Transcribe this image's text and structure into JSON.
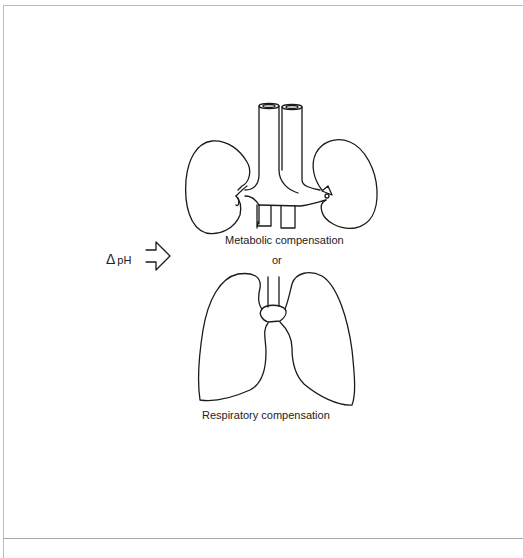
{
  "figure": {
    "trigger": {
      "delta_symbol": "Δ",
      "label": "pH",
      "arrow_icon": "hollow-right-arrow"
    },
    "organs": [
      {
        "name": "kidneys-and-great-vessels",
        "label": "Metabolic compensation"
      },
      {
        "name": "lungs-and-trachea",
        "label": "Respiratory compensation"
      }
    ],
    "connector_word": "or",
    "caption_cropped": ""
  },
  "colors": {
    "line": "#1a1a1a",
    "frame": "#bdbdbd",
    "background": "#ffffff"
  }
}
